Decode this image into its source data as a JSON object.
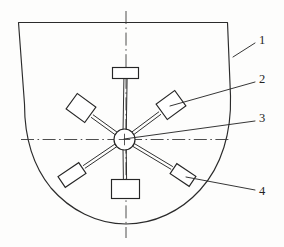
{
  "figure": {
    "background_color": "#fdfdfc",
    "line_color": "#2b2b2b",
    "centerline_color": "#3a3a3a",
    "blade_fill": "#ffffff"
  },
  "callouts": [
    {
      "id": "1",
      "label": "1",
      "text_x": 259,
      "text_y": 41,
      "leader_from_x": 233,
      "leader_from_y": 57,
      "leader_to_x": 255,
      "leader_to_y": 43,
      "target": "outer-shell-wall"
    },
    {
      "id": "2",
      "label": "2",
      "text_x": 259,
      "text_y": 80,
      "leader_from_x": 170,
      "leader_from_y": 106,
      "leader_to_x": 255,
      "leader_to_y": 82,
      "target": "upper-right-blade"
    },
    {
      "id": "3",
      "label": "3",
      "text_x": 259,
      "text_y": 119,
      "leader_from_x": 124,
      "leader_from_y": 139,
      "leader_to_x": 255,
      "leader_to_y": 121,
      "target": "center-hub"
    },
    {
      "id": "4",
      "label": "4",
      "text_x": 259,
      "text_y": 192,
      "leader_from_x": 186,
      "leader_from_y": 177,
      "leader_to_x": 255,
      "leader_to_y": 190,
      "target": "lower-right-blade"
    }
  ],
  "shell": {
    "name": "outer-shell",
    "path": "M 18.5 22.5 L 227.5 22.5 L 230.5 96 C 231.5 132, 222 166, 200 190 C 181 211, 154 224, 126 224 C 97 224, 70 210, 51 188 C 33 166, 24.5 136, 24.5 104 Z"
  },
  "centerlines": {
    "horizontal": {
      "x1": 21,
      "y1": 139.5,
      "x2": 229,
      "y2": 139.5
    },
    "vertical": {
      "x1": 126,
      "y1": 11,
      "x2": 126,
      "y2": 238
    }
  },
  "hub": {
    "name": "center-hub",
    "cx": 124.5,
    "cy": 139.5,
    "r": 10.5
  },
  "blades": [
    {
      "name": "top-blade",
      "angle_deg": 90,
      "shaft": {
        "x1": 124.5,
        "y1": 139.5,
        "x2": 125.5,
        "y2": 79
      },
      "rect": {
        "cx": 125.5,
        "cy": 73,
        "w": 26,
        "h": 11,
        "rot": 0
      }
    },
    {
      "name": "upper-right-blade",
      "angle_deg": 38,
      "shaft": {
        "x1": 124.5,
        "y1": 139.5,
        "x2": 160,
        "y2": 113
      },
      "rect": {
        "cx": 171,
        "cy": 105,
        "w": 23,
        "h": 19,
        "rot": -36
      }
    },
    {
      "name": "upper-left-blade",
      "angle_deg": 142,
      "shaft": {
        "x1": 124.5,
        "y1": 139.5,
        "x2": 92,
        "y2": 116
      },
      "rect": {
        "cx": 81,
        "cy": 108,
        "w": 23,
        "h": 19,
        "rot": 36
      }
    },
    {
      "name": "lower-left-blade",
      "angle_deg": 215,
      "shaft": {
        "x1": 124.5,
        "y1": 139.5,
        "x2": 84,
        "y2": 167
      },
      "rect": {
        "cx": 72,
        "cy": 175,
        "w": 25,
        "h": 13,
        "rot": -34
      }
    },
    {
      "name": "lower-right-blade",
      "angle_deg": 325,
      "shaft": {
        "x1": 124.5,
        "y1": 139.5,
        "x2": 172,
        "y2": 168
      },
      "rect": {
        "cx": 183,
        "cy": 175,
        "w": 23,
        "h": 12,
        "rot": 34
      }
    },
    {
      "name": "bottom-blade",
      "angle_deg": 270,
      "shaft": {
        "x1": 124.5,
        "y1": 139.5,
        "x2": 125,
        "y2": 180
      },
      "rect": {
        "cx": 125.5,
        "cy": 189,
        "w": 28,
        "h": 19,
        "rot": 0
      }
    }
  ]
}
